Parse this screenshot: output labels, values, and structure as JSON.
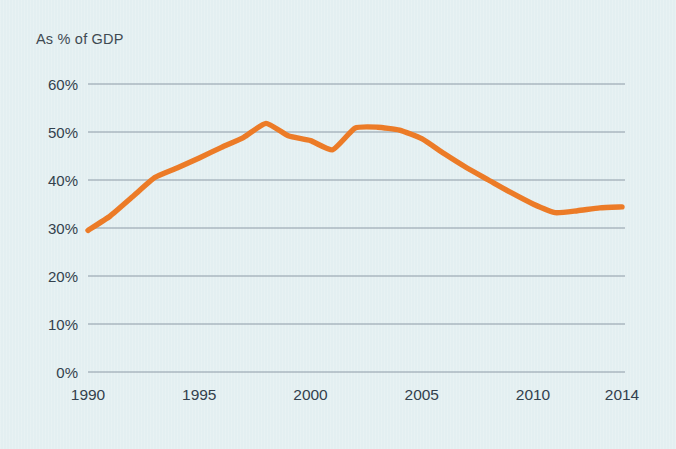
{
  "chart_data": {
    "type": "line",
    "title": "",
    "subtitle": "",
    "axis_note": "As % of GDP",
    "xlabel": "",
    "ylabel": "",
    "xlim": [
      1990,
      2014
    ],
    "ylim": [
      0,
      60
    ],
    "grid": "horizontal",
    "legend": "none",
    "line_color": "#ec7b27",
    "x": [
      1990,
      1991,
      1992,
      1993,
      1994,
      1995,
      1996,
      1997,
      1998,
      1999,
      2000,
      2001,
      2002,
      2003,
      2004,
      2005,
      2006,
      2007,
      2008,
      2009,
      2010,
      2011,
      2012,
      2013,
      2014
    ],
    "values": [
      29.5,
      32.5,
      36.5,
      40.5,
      42.5,
      44.6,
      46.8,
      48.9,
      51.8,
      49.2,
      48.2,
      46.3,
      50.8,
      51.0,
      50.4,
      48.6,
      45.5,
      42.6,
      40.0,
      37.4,
      35.0,
      33.2,
      33.6,
      34.2,
      34.4
    ],
    "xticks": [
      1990,
      1995,
      2000,
      2005,
      2010,
      2014
    ],
    "xtick_labels": [
      "1990",
      "1995",
      "2000",
      "2005",
      "2010",
      "2014"
    ],
    "yticks": [
      0,
      10,
      20,
      30,
      40,
      50,
      60
    ],
    "ytick_labels": [
      "0%",
      "10%",
      "20%",
      "30%",
      "40%",
      "50%",
      "60%"
    ]
  },
  "style": {
    "background": "#e3eff1",
    "gridline_color": "#8d9aa6",
    "tick_text_color": "#33414d",
    "note_text_color": "#3f4a52"
  }
}
